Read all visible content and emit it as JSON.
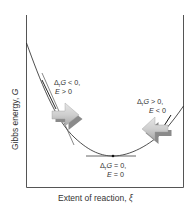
{
  "diagram": {
    "type": "gibbs-energy-vs-extent-of-reaction",
    "x_axis_label": "Extent of reaction, ",
    "x_axis_symbol": "ξ",
    "y_axis_label": "Gibbs energy, ",
    "y_axis_symbol": "G",
    "annotations": [
      {
        "id": "left",
        "line1_prefix": "Δ",
        "line1_sub": "r",
        "line1_var": "G",
        "line1_rest": " < 0,",
        "line2_var": "E",
        "line2_rest": " > 0",
        "arrow_direction": "right"
      },
      {
        "id": "right",
        "line1_prefix": "Δ",
        "line1_sub": "r",
        "line1_var": "G",
        "line1_rest": " > 0,",
        "line2_var": "E",
        "line2_rest": " < 0",
        "arrow_direction": "left"
      },
      {
        "id": "minimum",
        "line1_prefix": "Δ",
        "line1_sub": "r",
        "line1_var": "G",
        "line1_rest": " = 0,",
        "line2_var": "E",
        "line2_rest": " = 0",
        "arrow_direction": "none"
      }
    ],
    "colors": {
      "curve": "#222222",
      "axes": "#555555",
      "arrow_fill": "#c8c8c8",
      "arrow_shadow": "#8a8a8a",
      "text": "#333333"
    }
  }
}
